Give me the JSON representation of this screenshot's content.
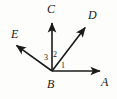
{
  "figure": {
    "type": "geometry-diagram",
    "background_color": "#fdfdfb",
    "stroke_color": "#1a1a1a",
    "canvas": {
      "width": 117,
      "height": 99
    },
    "vertex": {
      "name": "B",
      "x": 52,
      "y": 71
    },
    "rays": [
      {
        "name": "ray-BA",
        "from": "B",
        "to": "A",
        "tip_x": 104,
        "tip_y": 71,
        "arrow": true
      },
      {
        "name": "ray-BD",
        "from": "B",
        "to": "D",
        "tip_x": 88,
        "tip_y": 24,
        "arrow": true
      },
      {
        "name": "ray-BC",
        "from": "B",
        "to": "C",
        "tip_x": 52,
        "tip_y": 19,
        "arrow": true
      },
      {
        "name": "ray-BE",
        "from": "B",
        "to": "E",
        "tip_x": 13,
        "tip_y": 42,
        "arrow": true
      }
    ],
    "point_labels": {
      "A": "A",
      "B": "B",
      "C": "C",
      "D": "D",
      "E": "E"
    },
    "angle_labels": {
      "one": "1",
      "two": "2",
      "three": "3"
    },
    "angles": [
      {
        "label": "1",
        "between": "ray-BA and ray-BD"
      },
      {
        "label": "2",
        "between": "ray-BD and ray-BC"
      },
      {
        "label": "3",
        "between": "ray-BC and ray-BE"
      }
    ]
  }
}
